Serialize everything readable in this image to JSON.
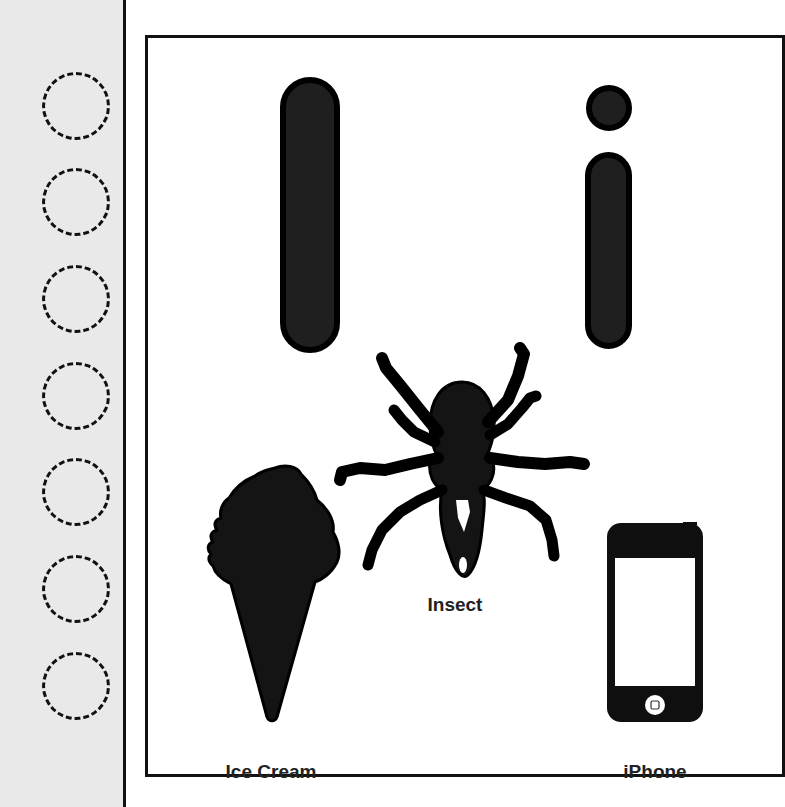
{
  "worksheet": {
    "letter_upper": "I",
    "letter_lower": "i",
    "tracing_circles": 7,
    "pictures": [
      {
        "name": "Ice Cream",
        "icon": "ice-cream-icon"
      },
      {
        "name": "Insect",
        "icon": "insect-icon"
      },
      {
        "name": "iPhone",
        "icon": "iphone-icon"
      }
    ]
  },
  "labels": {
    "ice_cream": "Ice Cream",
    "insect": "Insect",
    "iphone": "iPhone"
  },
  "colors": {
    "strip_bg": "#e9e9e9",
    "ink": "#111111",
    "letter_fill": "#1f1f1f",
    "paper": "#ffffff"
  }
}
